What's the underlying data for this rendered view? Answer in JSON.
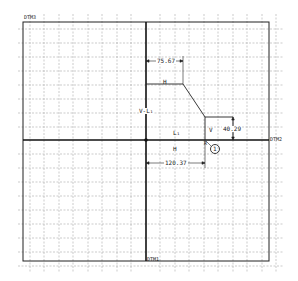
{
  "datums": {
    "dtm3": "DTM3",
    "dtm2": "DTM2",
    "dtm1": "DTM1"
  },
  "dimensions": {
    "top_width": "75.67",
    "bottom_width": "120.37",
    "right_height": "40.29"
  },
  "labels": {
    "h_top": "H",
    "h_bottom": "H",
    "v_right": "V",
    "l1_left": "V-L₁",
    "l1_center": "L₁",
    "callout_number": "1",
    "callout_letter": "R"
  },
  "colors": {
    "line": "#222222",
    "grid": "#9a9a9a",
    "background": "#ffffff"
  }
}
